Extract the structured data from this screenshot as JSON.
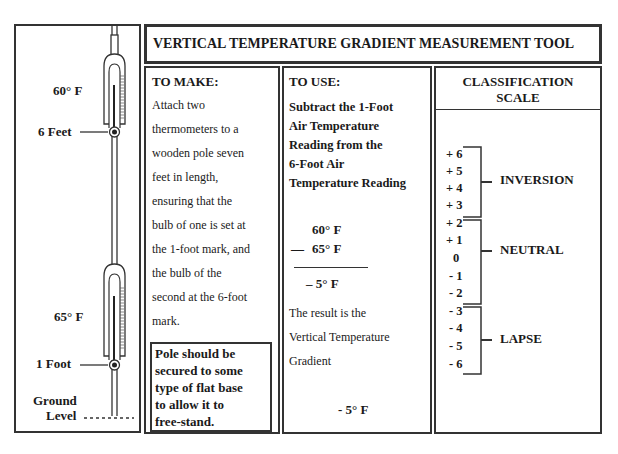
{
  "title": "VERTICAL TEMPERATURE GRADIENT  MEASUREMENT TOOL",
  "pole_diagram": {
    "upper_thermometer": {
      "reading": "60° F",
      "height_label": "6 Feet"
    },
    "lower_thermometer": {
      "reading": "65° F",
      "height_label": "1 Foot"
    },
    "ground_label_line1": "Ground",
    "ground_label_line2": "Level"
  },
  "to_make": {
    "heading": "TO MAKE:",
    "lines": [
      "Attach two",
      "thermometers to a",
      "wooden pole seven",
      "feet in length,",
      "ensuring that the",
      "bulb of one is set at",
      "the 1-foot mark, and",
      "the bulb of the",
      "second at the 6-foot",
      "mark."
    ],
    "note_lines": [
      "Pole should be",
      "secured to some",
      "type of flat base",
      "to allow it to",
      "free-stand."
    ]
  },
  "to_use": {
    "heading": "TO USE:",
    "instruction_lines": [
      "Subtract the 1-Foot",
      "Air Temperature",
      "Reading from the",
      "6-Foot   Air",
      "Temperature Reading"
    ],
    "calc": {
      "minuend": "60° F",
      "operator": "—",
      "subtrahend": "65° F",
      "result": "– 5° F"
    },
    "result_lines": [
      "The result is the",
      "Vertical Temperature",
      "Gradient"
    ],
    "final_value": "- 5° F"
  },
  "classification_scale": {
    "heading_line1": "CLASSIFICATION",
    "heading_line2": "SCALE",
    "groups": [
      {
        "name": "INVERSION",
        "values": [
          "+ 6",
          "+ 5",
          "+ 4",
          "+ 3"
        ]
      },
      {
        "name": "NEUTRAL",
        "values": [
          "+ 2",
          "+ 1",
          "0",
          "- 1",
          "- 2"
        ]
      },
      {
        "name": "LAPSE",
        "values": [
          "- 3",
          "- 4",
          "- 5",
          "- 6"
        ]
      }
    ]
  }
}
